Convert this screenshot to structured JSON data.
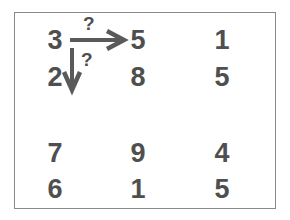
{
  "puzzle": {
    "grid": [
      [
        "3",
        "5",
        "1"
      ],
      [
        "2",
        "8",
        "5"
      ],
      [
        "7",
        "9",
        "4"
      ],
      [
        "6",
        "1",
        "5"
      ]
    ],
    "arrows": {
      "horizontal": {
        "from": "3",
        "to": "5",
        "label": "?"
      },
      "vertical": {
        "from": "3",
        "to": "2",
        "label": "?"
      }
    },
    "colors": {
      "digits": "#4f4f4f",
      "arrows": "#5a5a5a",
      "frame": "#8a8a8a",
      "background": "#ffffff"
    }
  }
}
